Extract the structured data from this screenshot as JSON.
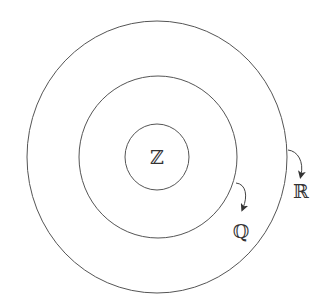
{
  "diagram": {
    "type": "nested-sets",
    "sets": [
      {
        "id": "integers",
        "label": "ℤ",
        "ring": "inner"
      },
      {
        "id": "rationals",
        "label": "ℚ",
        "ring": "middle"
      },
      {
        "id": "reals",
        "label": "ℝ",
        "ring": "outer"
      }
    ],
    "colors": {
      "stroke": "#555555",
      "text": "#333333",
      "background": "#ffffff"
    }
  }
}
